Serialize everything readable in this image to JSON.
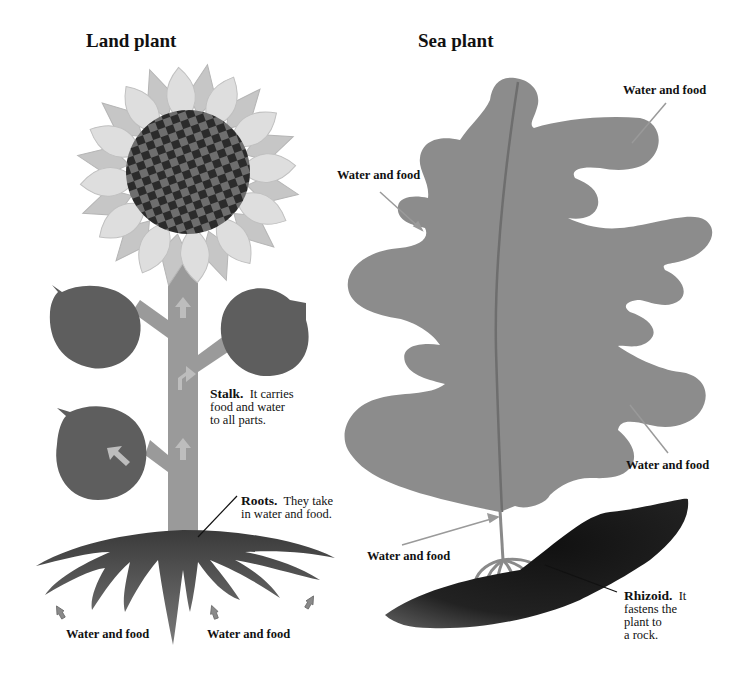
{
  "titles": {
    "land": "Land plant",
    "sea": "Sea plant"
  },
  "land_plant": {
    "stalk": {
      "term": "Stalk.",
      "text_lines": [
        "It carries",
        "food and water",
        "to all parts."
      ]
    },
    "roots": {
      "term": "Roots.",
      "text_lines": [
        "They take",
        "in water and food."
      ]
    },
    "water_labels": [
      "Water and food",
      "Water and food"
    ]
  },
  "sea_plant": {
    "water_labels": [
      "Water and food",
      "Water and food",
      "Water and food",
      "Water and food"
    ],
    "rhizoid": {
      "term": "Rhizoid.",
      "text_lines": [
        "It",
        "fastens the",
        "plant to",
        "a rock."
      ]
    }
  },
  "colors": {
    "petal": "#dcdcdc",
    "petal_back": "#c4c4c4",
    "center_dark": "#2b2b2b",
    "center_light": "#6e6e6e",
    "leaf": "#5e5e5e",
    "stalk": "#9a9a9a",
    "roots": "#555555",
    "seaweed": "#8c8c8c",
    "rock": "#1a1a1a",
    "arrow": "#a8a8a8"
  }
}
